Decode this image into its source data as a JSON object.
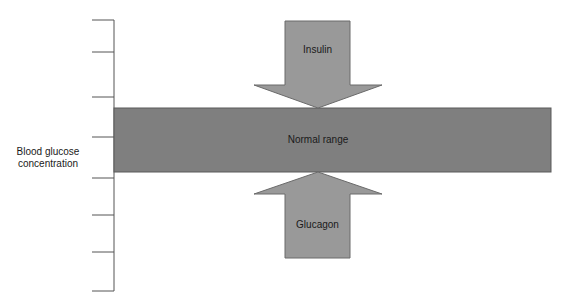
{
  "diagram": {
    "axis_label_line1": "Blood glucose",
    "axis_label_line2": "concentration",
    "band_label": "Normal range",
    "top_arrow_label": "Insulin",
    "bottom_arrow_label": "Glucagon",
    "axis_tick_count": 9,
    "colors": {
      "band": "#7f7f7f",
      "arrow": "#999999",
      "outline": "#5a5a5a",
      "axis": "#555555",
      "text": "#1a1a1a"
    }
  }
}
